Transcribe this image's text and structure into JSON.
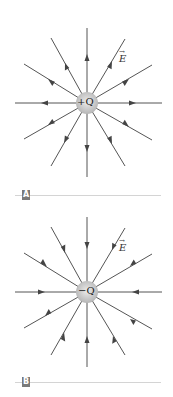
{
  "figure": {
    "panels": [
      {
        "id": "A",
        "tag_label": "A",
        "charge_label": "+Q",
        "field_label": "E",
        "field_label_vector_arrow": "→",
        "field_direction": "outward"
      },
      {
        "id": "B",
        "tag_label": "B",
        "charge_label": "−Q",
        "field_label": "E",
        "field_label_vector_arrow": "→",
        "field_direction": "inward"
      }
    ],
    "colors": {
      "field_line": "#555555",
      "charge_fill_center": "#e6e6e6",
      "charge_fill_edge": "#b8b8b8",
      "tag_background": "#7a7a7a",
      "separator": "#d4d4d4"
    },
    "field_line_count": 12
  }
}
